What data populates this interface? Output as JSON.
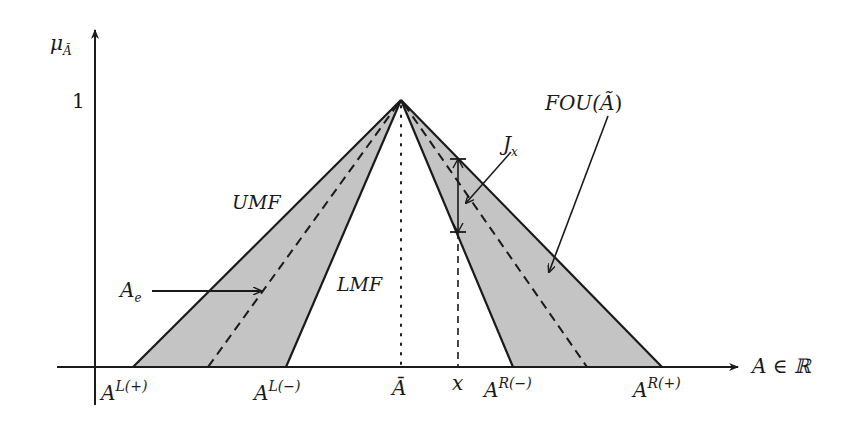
{
  "figure": {
    "type": "interval type-2 fuzzy set diagram",
    "colors": {
      "fou_fill": "#c4c4c4",
      "stroke": "#1a1a1a",
      "background": "#ffffff"
    },
    "axes": {
      "y_label_base": "μ",
      "y_label_sub": "Ã",
      "y_tick_one": "1",
      "x_label": "A ∈ ℝ"
    },
    "regions": {
      "umf": "UMF",
      "lmf": "LMF",
      "fou_base": "FOU(",
      "fou_arg": "Ã",
      "fou_close": ")",
      "embedded_base": "A",
      "embedded_sub": "e",
      "secondary_base": "J",
      "secondary_sub": "x"
    },
    "x_ticks": {
      "l_plus_base": "A",
      "l_plus_sup": "L(+)",
      "l_minus_base": "A",
      "l_minus_sup": "L(−)",
      "center": "Ā",
      "x": "x",
      "r_minus_base": "A",
      "r_minus_sup": "R(−)",
      "r_plus_base": "A",
      "r_plus_sup": "R(+)"
    },
    "geometry": {
      "apex": [
        401,
        100
      ],
      "baseline_y": 367,
      "base_points_x": {
        "A_L_plus": 133,
        "A_e_left": 208,
        "A_L_minus": 286,
        "A_bar": 401,
        "x": 458,
        "A_R_minus": 513,
        "A_e_right": 587,
        "A_R_plus": 662
      }
    }
  }
}
